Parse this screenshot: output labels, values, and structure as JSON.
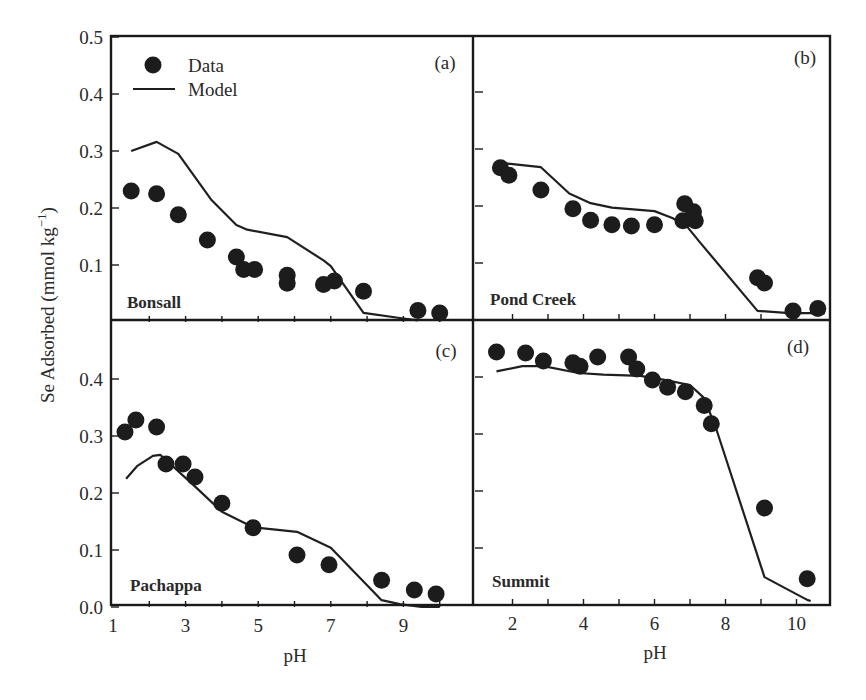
{
  "figure": {
    "y_axis_title": "Se Adsorbed (mmol kg",
    "y_axis_title_superscript": "−1",
    "y_axis_title_close": ")",
    "x_axis_title_left": "pH",
    "x_axis_title_right": "pH",
    "legend": {
      "data_label": "Data",
      "model_label": "Model"
    },
    "colors": {
      "ink": "#1c1c1c",
      "background": "#ffffff"
    }
  },
  "chart_data": [
    {
      "type": "scatter",
      "panel": "(a)",
      "title": "Bonsall",
      "xlabel": "pH",
      "ylabel": "Se Adsorbed (mmol kg−1)",
      "xlim": [
        1,
        10.9
      ],
      "ylim": [
        0,
        0.5
      ],
      "yticks": [
        0.1,
        0.2,
        0.3,
        0.4,
        0.5
      ],
      "ytick_labels": [
        "0.1",
        "0.2",
        "0.3",
        "0.4",
        "0.5"
      ],
      "xticks": [],
      "xtick_labels": [],
      "grid": false,
      "legend_position": "upper left",
      "series": [
        {
          "name": "Data",
          "style": "markers",
          "x": [
            1.5,
            2.2,
            2.8,
            3.6,
            4.4,
            4.6,
            4.9,
            5.8,
            5.8,
            6.8,
            7.1,
            7.9,
            9.4,
            10.0
          ],
          "y": [
            0.23,
            0.225,
            0.188,
            0.144,
            0.114,
            0.092,
            0.092,
            0.082,
            0.068,
            0.066,
            0.072,
            0.054,
            0.02,
            0.016
          ]
        },
        {
          "name": "Model",
          "style": "line",
          "x": [
            1.5,
            2.2,
            2.8,
            3.7,
            4.4,
            4.7,
            5.8,
            6.8,
            7.0,
            7.9,
            8.9,
            9.4
          ],
          "y": [
            0.3,
            0.316,
            0.295,
            0.215,
            0.17,
            0.162,
            0.149,
            0.108,
            0.098,
            0.016,
            0.007,
            0.003
          ]
        }
      ]
    },
    {
      "type": "scatter",
      "panel": "(b)",
      "title": "Pond Creek",
      "xlabel": "pH",
      "ylabel": "",
      "xlim": [
        1,
        11
      ],
      "ylim": [
        0,
        0.5
      ],
      "yticks": [
        0.1,
        0.2,
        0.3,
        0.4
      ],
      "ytick_labels": [],
      "xticks": [],
      "xtick_labels": [],
      "grid": false,
      "series": [
        {
          "name": "Data",
          "style": "markers",
          "x": [
            1.66,
            1.9,
            2.8,
            3.7,
            4.2,
            4.8,
            5.35,
            6.0,
            6.85,
            6.8,
            7.1,
            7.15,
            8.9,
            9.1,
            9.9,
            10.6
          ],
          "y": [
            0.267,
            0.254,
            0.228,
            0.195,
            0.175,
            0.167,
            0.165,
            0.167,
            0.204,
            0.174,
            0.19,
            0.174,
            0.074,
            0.065,
            0.016,
            0.02
          ]
        },
        {
          "name": "Model",
          "style": "line",
          "x": [
            1.8,
            2.8,
            3.6,
            4.2,
            4.8,
            6.0,
            6.5,
            6.9,
            7.3,
            8.9,
            9.8,
            10.8
          ],
          "y": [
            0.275,
            0.268,
            0.222,
            0.205,
            0.197,
            0.191,
            0.179,
            0.165,
            0.135,
            0.016,
            0.012,
            0.012
          ]
        }
      ]
    },
    {
      "type": "scatter",
      "panel": "(c)",
      "title": "Pachappa",
      "xlabel": "pH",
      "ylabel": "Se Adsorbed (mmol kg−1)",
      "xlim": [
        1,
        10.9
      ],
      "ylim": [
        0,
        0.5
      ],
      "yticks": [
        0.0,
        0.1,
        0.2,
        0.3,
        0.4
      ],
      "ytick_labels": [
        "0.0",
        "0.1",
        "0.2",
        "0.3",
        "0.4"
      ],
      "xticks": [
        1,
        3,
        5,
        7,
        9
      ],
      "xtick_labels": [
        "1",
        "3",
        "5",
        "7",
        "9"
      ],
      "grid": false,
      "series": [
        {
          "name": "Data",
          "style": "markers",
          "x": [
            1.33,
            1.63,
            2.2,
            2.46,
            2.93,
            3.26,
            4.0,
            4.86,
            6.07,
            6.95,
            8.4,
            9.3,
            9.9
          ],
          "y": [
            0.307,
            0.328,
            0.316,
            0.251,
            0.251,
            0.228,
            0.182,
            0.139,
            0.091,
            0.074,
            0.047,
            0.03,
            0.023
          ]
        },
        {
          "name": "Model",
          "style": "line",
          "x": [
            1.36,
            1.66,
            2.1,
            2.3,
            3.3,
            4.0,
            4.86,
            6.07,
            7.0,
            8.4,
            8.9,
            9.5,
            10.0
          ],
          "y": [
            0.225,
            0.247,
            0.265,
            0.267,
            0.209,
            0.167,
            0.14,
            0.132,
            0.104,
            0.012,
            0.005,
            0.0,
            0.0
          ]
        }
      ]
    },
    {
      "type": "scatter",
      "panel": "(d)",
      "title": "Summit",
      "xlabel": "pH",
      "ylabel": "",
      "xlim": [
        1,
        11
      ],
      "ylim": [
        0,
        0.5
      ],
      "yticks": [
        0.1,
        0.2,
        0.3,
        0.4
      ],
      "ytick_labels": [],
      "xticks": [
        2,
        4,
        6,
        8,
        10
      ],
      "xtick_labels": [
        "2",
        "4",
        "6",
        "8",
        "10"
      ],
      "grid": false,
      "series": [
        {
          "name": "Data",
          "style": "markers",
          "x": [
            1.55,
            2.37,
            2.87,
            3.7,
            3.9,
            4.4,
            5.27,
            5.5,
            5.94,
            6.37,
            6.87,
            7.4,
            7.6,
            9.1,
            10.3
          ],
          "y": [
            0.444,
            0.442,
            0.428,
            0.425,
            0.419,
            0.435,
            0.435,
            0.414,
            0.395,
            0.382,
            0.374,
            0.35,
            0.318,
            0.17,
            0.046
          ]
        },
        {
          "name": "Model",
          "style": "line",
          "x": [
            1.55,
            2.28,
            2.87,
            3.86,
            4.56,
            5.6,
            6.28,
            7.0,
            7.4,
            7.75,
            9.1,
            10.3,
            10.4
          ],
          "y": [
            0.41,
            0.419,
            0.419,
            0.407,
            0.404,
            0.402,
            0.395,
            0.386,
            0.363,
            0.307,
            0.049,
            0.009,
            0.007
          ]
        }
      ]
    }
  ]
}
